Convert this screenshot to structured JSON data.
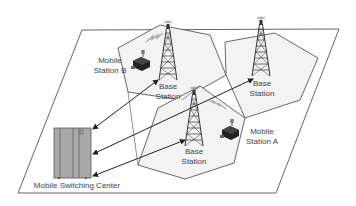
{
  "diagram": {
    "nodes": {
      "base_station_left": {
        "line1": "Base",
        "line2": "Station"
      },
      "base_station_right": {
        "line1": "Base",
        "line2": "Station"
      },
      "base_station_center": {
        "line1": "Base",
        "line2": "Station"
      },
      "mobile_station_b": {
        "line1": "Mobile",
        "line2": "Station B"
      },
      "mobile_station_a": {
        "line1": "Mobile",
        "line2": "Station A"
      },
      "msc": {
        "label": "Mobile Switching Center"
      }
    },
    "edges": [
      {
        "from": "msc",
        "to": "base_station_left",
        "type": "bidirectional-arrow"
      },
      {
        "from": "msc",
        "to": "base_station_right",
        "type": "bidirectional-arrow"
      },
      {
        "from": "msc",
        "to": "base_station_center",
        "type": "bidirectional-arrow"
      },
      {
        "from": "base_station_left",
        "to": "mobile_station_b",
        "type": "wireless-link"
      },
      {
        "from": "base_station_center",
        "to": "mobile_station_a",
        "type": "wireless-link"
      }
    ],
    "colors": {
      "plane_stroke": "#555555",
      "cell_fill": "#f2f2f2",
      "cell_stroke": "#444444",
      "tower": "#333333",
      "cabinet_fill": "#a8a8a8",
      "text": "#444444"
    }
  }
}
